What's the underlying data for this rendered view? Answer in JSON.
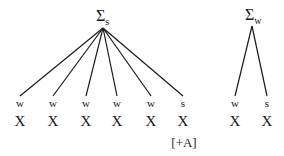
{
  "diagram": {
    "trees": [
      {
        "id": "strong-foot",
        "root": {
          "symbol": "Σ",
          "subscript": "s",
          "x": 103,
          "y": 28
        },
        "leaves": [
          {
            "stress": "w",
            "segment": "X",
            "x": 20
          },
          {
            "stress": "w",
            "segment": "X",
            "x": 53
          },
          {
            "stress": "w",
            "segment": "X",
            "x": 86
          },
          {
            "stress": "w",
            "segment": "X",
            "x": 117
          },
          {
            "stress": "w",
            "segment": "X",
            "x": 151
          },
          {
            "stress": "s",
            "segment": "X",
            "x": 183,
            "feature": "[+A]"
          }
        ]
      },
      {
        "id": "weak-foot",
        "root": {
          "symbol": "Σ",
          "subscript": "w",
          "x": 252,
          "y": 26
        },
        "leaves": [
          {
            "stress": "w",
            "segment": "X",
            "x": 235
          },
          {
            "stress": "s",
            "segment": "X",
            "x": 267
          }
        ]
      }
    ],
    "line_color": "#1a1a1a"
  }
}
